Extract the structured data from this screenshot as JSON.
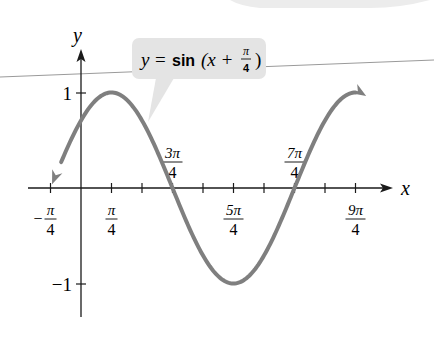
{
  "chart_data": {
    "type": "line",
    "equation": {
      "lhs": "y",
      "equals": "=",
      "func": "sin",
      "open": "(x +",
      "frac_num": "π",
      "frac_den": "4",
      "close": ")"
    },
    "xlabel": "x",
    "ylabel": "y",
    "x_unit": "π/4",
    "xlim_units_of_pi_over_4": [
      -1.7,
      10.2
    ],
    "ylim": [
      -1.35,
      1.45
    ],
    "x_ticks_units_of_pi_over_4": [
      -1,
      1,
      2,
      3,
      4,
      5,
      6,
      7,
      8,
      9
    ],
    "x_tick_labels": [
      {
        "num": "π",
        "den": "4",
        "sign": "−",
        "value": "-π/4",
        "position": "below"
      },
      {
        "num": "π",
        "den": "4",
        "sign": "",
        "value": "π/4",
        "position": "below"
      },
      {
        "num": "3π",
        "den": "4",
        "sign": "",
        "value": "3π/4",
        "position": "above"
      },
      {
        "num": "5π",
        "den": "4",
        "sign": "",
        "value": "5π/4",
        "position": "below"
      },
      {
        "num": "7π",
        "den": "4",
        "sign": "",
        "value": "7π/4",
        "position": "above"
      },
      {
        "num": "9π",
        "den": "4",
        "sign": "",
        "value": "9π/4",
        "position": "below"
      }
    ],
    "y_ticks": [
      1,
      -1
    ],
    "y_tick_labels": [
      "1",
      "−1"
    ],
    "series": [
      {
        "name": "y = sin(x + π/4)",
        "x_range_units_of_pi_over_4": [
          -1,
          9.35
        ],
        "key_points": [
          {
            "x": "-π/4",
            "y": 0
          },
          {
            "x": "0",
            "y": 0.707
          },
          {
            "x": "π/4",
            "y": 1
          },
          {
            "x": "3π/4",
            "y": 0
          },
          {
            "x": "5π/4",
            "y": -1
          },
          {
            "x": "7π/4",
            "y": 0
          },
          {
            "x": "9π/4",
            "y": 1
          }
        ],
        "arrow_ends": true
      }
    ],
    "grid": false,
    "legend": "callout label near top"
  },
  "colors": {
    "curve": "#7f7f7f",
    "axis": "#1a1a1a",
    "callout_fill": "#e4e4e4",
    "guide_line": "#9a9a9a"
  }
}
